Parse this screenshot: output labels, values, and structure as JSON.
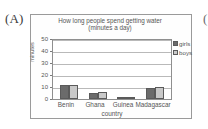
{
  "figure": {
    "panel_label": "(A)",
    "next_panel_label": "("
  },
  "chart_data": {
    "type": "bar",
    "title": "How long people spend getting water",
    "subtitle": "(minutes a day)",
    "categories": [
      "Benin",
      "Ghana",
      "Guinea",
      "Madagascar"
    ],
    "series": [
      {
        "name": "girls",
        "values": [
          12,
          5,
          2,
          9
        ],
        "color": "#6b6b6b"
      },
      {
        "name": "boys",
        "values": [
          12,
          6,
          2,
          10
        ],
        "color": "#c9c9c9"
      }
    ],
    "xlabel": "country",
    "ylabel": "minutes",
    "ylim": [
      0,
      50
    ],
    "yticks": [
      0,
      10,
      20,
      30,
      40,
      50
    ],
    "grid": true,
    "legend_position": "right"
  },
  "legend": {
    "items": [
      {
        "label": "girls",
        "color": "#6b6b6b"
      },
      {
        "label": "boys",
        "color": "#c9c9c9"
      }
    ]
  },
  "colors": {
    "frame": "#9a9a9a",
    "grid": "#b9b9b9",
    "text": "#555555",
    "bar_border": "#5a5a5a"
  }
}
